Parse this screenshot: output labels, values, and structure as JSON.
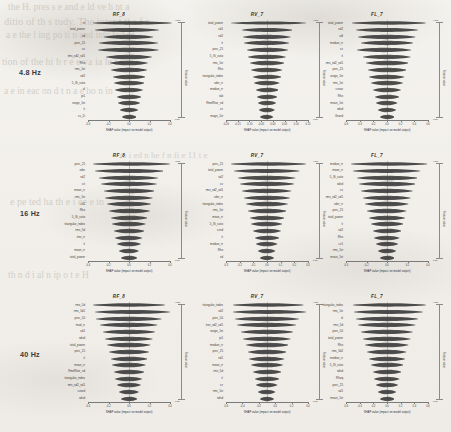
{
  "figure": {
    "background_color": "#f2f0ec",
    "ink_color": "#2b2b2b",
    "row_labels": [
      "4.8 Hz",
      "16 Hz",
      "40 Hz"
    ],
    "colorbar": {
      "high_label": "High",
      "low_label": "Low",
      "title": "Feature value"
    },
    "ghost_text": [
      "the H. pres s e and e ld ve h nt a",
      "ditio of th s tudy. The inter t ti s f r",
      "a e the l ing po ti n and inhi ted ca",
      "tion of the hi h r e e va ia le t e",
      "a e in eac on d t n a e ho n in",
      "ta i ed n he f n fi e 11 t e",
      "e pe ted ha th e i ee e in",
      "th n d i al n ip o t e H"
    ]
  },
  "chart_data": [
    {
      "type": "violin",
      "title": "RF_8",
      "row": "4.8 Hz",
      "xlabel": "SHAP value (impact on model output)",
      "ylabel": "",
      "xticks": [
        "-0.4",
        "-0.2",
        "0.0",
        "0.2",
        "0.4"
      ],
      "xlim": [
        -0.5,
        0.5
      ],
      "features": [
        "st",
        "total_power",
        "sd",
        "perc_25",
        "cv",
        "rms_sd2_sd1",
        "Rho",
        "rms_1st",
        "sd2",
        "5_IS_ratio",
        "sl",
        "pi1",
        "range_1st",
        "ti",
        "cv_2t"
      ],
      "widths": [
        0.96,
        0.78,
        0.6,
        0.72,
        0.74,
        0.56,
        0.46,
        0.44,
        0.4,
        0.37,
        0.34,
        0.3,
        0.27,
        0.22,
        0.18
      ],
      "heights": [
        2.4,
        2.8,
        3.0,
        3.0,
        3.0,
        3.2,
        3.2,
        3.2,
        3.2,
        3.2,
        3.2,
        3.2,
        3.2,
        3.0,
        3.0
      ],
      "offsets": [
        0.04,
        -0.02,
        0.0,
        0.0,
        -0.01,
        0.0,
        0.0,
        0.0,
        0.0,
        0.0,
        0.0,
        0.0,
        0.0,
        0.0,
        0.0
      ]
    },
    {
      "type": "violin",
      "title": "RV_7",
      "row": "4.8 Hz",
      "xlabel": "SHAP value (impact on model output)",
      "ylabel": "",
      "xticks": [
        "-0.20",
        "-0.15",
        "-0.10",
        "-0.05",
        "0.00",
        "0.05",
        "0.10",
        "0.15"
      ],
      "xlim": [
        -0.22,
        0.17
      ],
      "features": [
        "total_power",
        "sd1",
        "sd2",
        "ti",
        "perc_25",
        "5_IS_ratio",
        "rms_1st",
        "Rho",
        "triangular_index",
        "sdsr_rr",
        "median_rr",
        "tab",
        "RmsRhor_sd",
        "cv",
        "magn_1st"
      ],
      "widths": [
        0.92,
        0.62,
        0.58,
        0.55,
        0.5,
        0.46,
        0.42,
        0.38,
        0.35,
        0.31,
        0.28,
        0.25,
        0.22,
        0.19,
        0.16
      ],
      "heights": [
        2.2,
        2.8,
        3.0,
        3.0,
        3.0,
        3.0,
        3.2,
        3.2,
        3.2,
        3.2,
        3.2,
        3.2,
        3.2,
        3.2,
        3.0
      ],
      "offsets": [
        0.02,
        0.0,
        0.0,
        0.0,
        0.0,
        0.0,
        0.0,
        0.0,
        0.0,
        0.0,
        0.0,
        0.0,
        0.0,
        0.0,
        0.0
      ]
    },
    {
      "type": "violin",
      "title": "FL_7",
      "row": "4.8 Hz",
      "xlabel": "SHAP value (impact on model output)",
      "ylabel": "",
      "xticks": [
        "-0.6",
        "-0.4",
        "-0.2",
        "0.0",
        "0.2",
        "0.4",
        "0.6"
      ],
      "xlim": [
        -0.7,
        0.7
      ],
      "features": [
        "total_power",
        "sd2",
        "sdl",
        "median_rr",
        "cv",
        "ti",
        "rms_sd2_sd1",
        "perc_25",
        "range_1st",
        "rms_1st",
        "cvsos",
        "Rho",
        "mean_1st",
        "sdsd",
        "Grand"
      ],
      "widths": [
        0.9,
        0.76,
        0.7,
        0.64,
        0.66,
        0.58,
        0.52,
        0.47,
        0.43,
        0.39,
        0.34,
        0.3,
        0.26,
        0.22,
        0.18
      ],
      "heights": [
        2.4,
        2.8,
        3.0,
        3.0,
        3.0,
        3.0,
        3.2,
        3.2,
        3.2,
        3.2,
        3.2,
        3.2,
        3.2,
        3.2,
        3.0
      ],
      "offsets": [
        0.02,
        0.0,
        0.0,
        0.0,
        -0.03,
        0.0,
        0.0,
        0.0,
        0.0,
        0.0,
        0.0,
        0.0,
        0.0,
        0.0,
        0.0
      ]
    },
    {
      "type": "violin",
      "title": "RF_8",
      "row": "16 Hz",
      "xlabel": "SHAP value (impact on model output)",
      "ylabel": "",
      "xticks": [
        "-0.4",
        "-0.2",
        "0.0",
        "0.2",
        "0.4"
      ],
      "xlim": [
        -0.5,
        0.5
      ],
      "features": [
        "perc_25",
        "sdsr",
        "sd2",
        "cit",
        "mean_rr",
        "rms_1st",
        "cit2",
        "Rho",
        "5_IS_ratio",
        "triangular_index",
        "rms_5d",
        "rtev_rr",
        "ti",
        "mean_rr",
        "total_power"
      ],
      "widths": [
        0.94,
        0.84,
        0.72,
        0.68,
        0.62,
        0.58,
        0.54,
        0.5,
        0.45,
        0.41,
        0.37,
        0.33,
        0.29,
        0.24,
        0.2
      ],
      "heights": [
        2.4,
        2.8,
        3.0,
        3.0,
        3.0,
        3.0,
        3.2,
        3.2,
        3.2,
        3.2,
        3.2,
        3.2,
        3.2,
        3.2,
        3.0
      ],
      "offsets": [
        0.03,
        0.0,
        0.0,
        0.0,
        0.0,
        0.0,
        0.0,
        0.0,
        0.0,
        0.0,
        0.0,
        0.0,
        0.0,
        0.0,
        0.0
      ]
    },
    {
      "type": "violin",
      "title": "RV_7",
      "row": "16 Hz",
      "xlabel": "SHAP value (impact on model output)",
      "ylabel": "",
      "xticks": [
        "-0.3",
        "-0.2",
        "-0.1",
        "0.0",
        "0.1",
        "0.2",
        "0.3"
      ],
      "xlim": [
        -0.35,
        0.35
      ],
      "features": [
        "perc_25",
        "total_power",
        "sd2",
        "cv",
        "rms_sd2_sd1",
        "sdsr_rr",
        "triangular_index",
        "rms_1st",
        "mean_rr",
        "5_IS_ratio",
        "cvsd",
        "ti",
        "median_rr",
        "Rho",
        "sd"
      ],
      "widths": [
        0.92,
        0.8,
        0.7,
        0.66,
        0.6,
        0.56,
        0.51,
        0.47,
        0.42,
        0.38,
        0.34,
        0.3,
        0.26,
        0.21,
        0.17
      ],
      "heights": [
        2.4,
        2.8,
        3.0,
        3.0,
        3.0,
        3.0,
        3.2,
        3.2,
        3.2,
        3.2,
        3.2,
        3.2,
        3.2,
        3.2,
        3.0
      ],
      "offsets": [
        0.02,
        0.0,
        0.0,
        0.0,
        0.0,
        0.0,
        0.0,
        0.0,
        0.0,
        0.0,
        0.0,
        0.0,
        0.0,
        0.0,
        0.0
      ]
    },
    {
      "type": "violin",
      "title": "FL_7",
      "row": "16 Hz",
      "xlabel": "SHAP value (impact on model output)",
      "ylabel": "",
      "xticks": [
        "-0.4",
        "-0.2",
        "0.0",
        "0.2",
        "0.4"
      ],
      "xlim": [
        -0.5,
        0.5
      ],
      "features": [
        "median_rr",
        "mean_rr",
        "5_IS_ratio",
        "sdsd",
        "cv",
        "rms_sd2_sd1",
        "sdsr_rr",
        "perc_25",
        "total_power",
        "ti",
        "sd2",
        "Rho",
        "cv1",
        "rms_1st",
        "mean_1st"
      ],
      "widths": [
        0.93,
        0.82,
        0.74,
        0.69,
        0.63,
        0.58,
        0.53,
        0.48,
        0.44,
        0.4,
        0.35,
        0.31,
        0.27,
        0.22,
        0.18
      ],
      "heights": [
        2.4,
        2.8,
        3.0,
        3.0,
        3.0,
        3.0,
        3.2,
        3.2,
        3.2,
        3.2,
        3.2,
        3.2,
        3.2,
        3.2,
        3.0
      ],
      "offsets": [
        0.03,
        0.0,
        0.0,
        0.0,
        0.0,
        0.0,
        0.0,
        0.0,
        0.0,
        0.0,
        0.0,
        0.0,
        0.0,
        0.0,
        0.0
      ]
    },
    {
      "type": "violin",
      "title": "RF_8",
      "row": "40 Hz",
      "xlabel": "SHAP value (impact on model output)",
      "ylabel": "",
      "xticks": [
        "-0.4",
        "-0.2",
        "0.0",
        "0.2",
        "0.4"
      ],
      "xlim": [
        -0.5,
        0.5
      ],
      "features": [
        "rms_5d",
        "rms_5d1",
        "perc_50",
        "mad_rr",
        "sd1",
        "sdsd",
        "total_power",
        "perc_25",
        "ti",
        "mean_rr",
        "RmsRhor_sd",
        "triangular_index",
        "rms_sd2_sd1",
        "cvsed",
        "sdsd"
      ],
      "widths": [
        0.88,
        0.92,
        0.8,
        0.7,
        0.64,
        0.58,
        0.53,
        0.49,
        0.45,
        0.41,
        0.37,
        0.33,
        0.29,
        0.24,
        0.2
      ],
      "heights": [
        2.4,
        2.8,
        3.0,
        3.0,
        3.0,
        3.0,
        3.2,
        3.2,
        3.2,
        3.2,
        3.2,
        3.2,
        3.2,
        3.2,
        3.0
      ],
      "offsets": [
        0.0,
        0.04,
        0.0,
        0.0,
        0.0,
        0.0,
        0.0,
        0.0,
        0.0,
        0.0,
        0.0,
        0.0,
        0.0,
        0.0,
        0.0
      ]
    },
    {
      "type": "violin",
      "title": "RV_7",
      "row": "40 Hz",
      "xlabel": "SHAP value (impact on model output)",
      "ylabel": "",
      "xticks": [
        "-0.6",
        "-0.4",
        "-0.2",
        "0.0",
        "0.2",
        "0.4"
      ],
      "xlim": [
        -0.65,
        0.5
      ],
      "features": [
        "triangular_index",
        "sd2",
        "perc_50",
        "rtev_sd2_sd1",
        "range_1st",
        "pi1",
        "median_rr",
        "perc_25",
        "sd1",
        "mean_rr",
        "rms_5d",
        "ti",
        "cv",
        "rms_1st",
        "sdsd"
      ],
      "widths": [
        0.86,
        0.9,
        0.78,
        0.72,
        0.64,
        0.58,
        0.52,
        0.47,
        0.43,
        0.39,
        0.35,
        0.3,
        0.26,
        0.21,
        0.17
      ],
      "heights": [
        2.4,
        2.8,
        3.0,
        3.0,
        3.0,
        3.0,
        3.2,
        3.2,
        3.2,
        3.2,
        3.2,
        3.2,
        3.2,
        3.2,
        3.0
      ],
      "offsets": [
        0.02,
        0.03,
        0.0,
        0.0,
        0.0,
        0.0,
        0.0,
        0.0,
        0.0,
        0.0,
        0.0,
        0.0,
        0.0,
        0.0,
        0.0
      ]
    },
    {
      "type": "violin",
      "title": "FL_7",
      "row": "40 Hz",
      "xlabel": "SHAP value (impact on model output)",
      "ylabel": "",
      "xticks": [
        "-0.6",
        "-0.4",
        "-0.2",
        "0.0",
        "0.2",
        "0.4",
        "0.6"
      ],
      "xlim": [
        -0.7,
        0.7
      ],
      "features": [
        "triangular_index",
        "rms_1st",
        "sl",
        "rms_5d",
        "perc_50",
        "total_power",
        "Rho",
        "rms_5d2",
        "median_rr",
        "5_IS_ratio",
        "sdsd",
        "Rhoq",
        "perc_25",
        "sd1",
        "mean_1st"
      ],
      "widths": [
        0.9,
        0.84,
        0.76,
        0.7,
        0.63,
        0.58,
        0.53,
        0.48,
        0.44,
        0.4,
        0.35,
        0.31,
        0.27,
        0.22,
        0.18
      ],
      "heights": [
        2.4,
        2.8,
        3.0,
        3.0,
        3.0,
        3.0,
        3.2,
        3.2,
        3.2,
        3.2,
        3.2,
        3.2,
        3.2,
        3.2,
        3.0
      ],
      "offsets": [
        0.03,
        0.02,
        0.0,
        0.0,
        0.0,
        0.0,
        0.0,
        0.0,
        0.0,
        0.0,
        0.0,
        0.0,
        0.0,
        0.0,
        0.0
      ]
    }
  ]
}
